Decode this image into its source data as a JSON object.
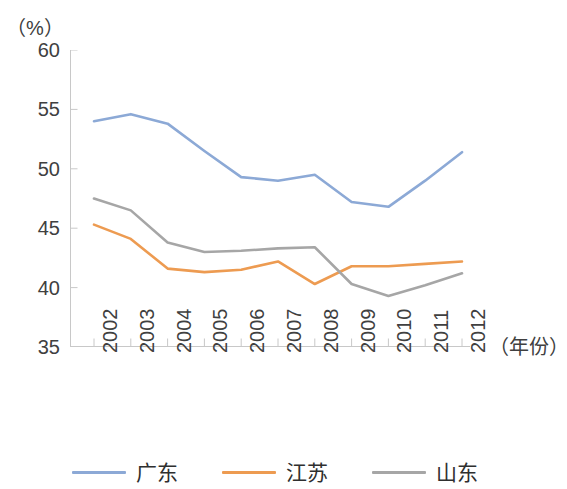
{
  "chart_data": {
    "type": "line",
    "title": "",
    "subtitle": "",
    "xlabel": "（年份）",
    "ylabel": "（%）",
    "unit_label": "（%）",
    "x": [
      "2002",
      "2003",
      "2004",
      "2005",
      "2006",
      "2007",
      "2008",
      "2009",
      "2010",
      "2011",
      "2012"
    ],
    "categories": [
      "2002",
      "2003",
      "2004",
      "2005",
      "2006",
      "2007",
      "2008",
      "2009",
      "2010",
      "2011",
      "2012"
    ],
    "ylim": [
      35,
      60
    ],
    "yticks": [
      60,
      55,
      50,
      45,
      40,
      35
    ],
    "ytick_labels": [
      "60",
      "55",
      "50",
      "45",
      "40",
      "35"
    ],
    "grid": false,
    "legend_position": "bottom",
    "series": [
      {
        "name": "广东",
        "color": "#8CA9D6",
        "values": [
          54.0,
          54.6,
          53.8,
          51.5,
          49.3,
          49.0,
          49.5,
          47.2,
          46.8,
          49.0,
          51.4
        ]
      },
      {
        "name": "江苏",
        "color": "#ED9B51",
        "values": [
          45.3,
          44.1,
          41.6,
          41.3,
          41.5,
          42.2,
          40.3,
          41.8,
          41.8,
          42.0,
          42.2
        ]
      },
      {
        "name": "山东",
        "color": "#A6A6A6",
        "values": [
          47.5,
          46.5,
          43.8,
          43.0,
          43.1,
          43.3,
          43.4,
          40.3,
          39.3,
          40.2,
          41.2
        ]
      }
    ]
  },
  "legend": {
    "items": [
      {
        "label": "广东",
        "color": "#8CA9D6"
      },
      {
        "label": "江苏",
        "color": "#ED9B51"
      },
      {
        "label": "山东",
        "color": "#A6A6A6"
      }
    ]
  },
  "axes": {
    "y_unit": "（%）",
    "x_title": "（年份）"
  }
}
